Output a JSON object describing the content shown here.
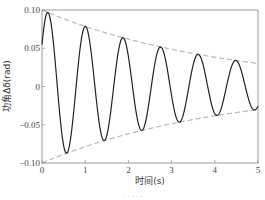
{
  "chart_data": {
    "type": "line",
    "title": "",
    "xlabel": "时间(s)",
    "ylabel": "功角Δδ(rad)",
    "xlim": [
      0,
      5
    ],
    "ylim": [
      -0.1,
      0.1
    ],
    "x_ticks": [
      "0",
      "1",
      "2",
      "3",
      "4",
      "5"
    ],
    "y_ticks": [
      "0.10",
      "0.05",
      "0",
      "-0.05",
      "-0.10"
    ],
    "grid": false,
    "legend": null,
    "series": [
      {
        "name": "Δδ(t)",
        "style": "solid",
        "color": "#222222",
        "model": {
          "amplitude": 0.1,
          "decay": 0.24,
          "omega": 7.22,
          "phase": 0.99
        },
        "peaks": [
          [
            0.14,
            0.097
          ],
          [
            1.01,
            0.078
          ],
          [
            1.88,
            0.063
          ],
          [
            2.75,
            0.051
          ],
          [
            3.62,
            0.041
          ],
          [
            4.49,
            0.033
          ]
        ],
        "troughs": [
          [
            0.57,
            -0.087
          ],
          [
            1.44,
            -0.07
          ],
          [
            2.31,
            -0.057
          ],
          [
            3.18,
            -0.046
          ],
          [
            4.06,
            -0.037
          ],
          [
            4.93,
            -0.03
          ]
        ],
        "start": [
          0,
          0.055
        ]
      },
      {
        "name": "upper envelope",
        "style": "dashed",
        "color": "#888888",
        "x": [
          0,
          1,
          2,
          3,
          4,
          5
        ],
        "values": [
          0.1,
          0.079,
          0.062,
          0.049,
          0.038,
          0.03
        ]
      },
      {
        "name": "lower envelope",
        "style": "dashed",
        "color": "#888888",
        "x": [
          0,
          1,
          2,
          3,
          4,
          5
        ],
        "values": [
          -0.1,
          -0.079,
          -0.062,
          -0.049,
          -0.038,
          -0.03
        ]
      }
    ]
  },
  "labels": {
    "xlabel": "时间(s)",
    "ylabel": "功角Δδ(rad)",
    "caption": "· · · · ·"
  }
}
